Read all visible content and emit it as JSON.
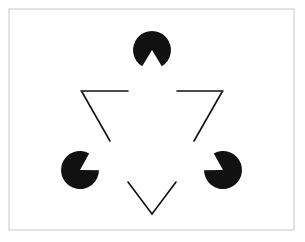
{
  "figure": {
    "name": "Kanizsa triangle illusion",
    "caption": "",
    "canvas": {
      "width": 305,
      "height": 242
    },
    "colors": {
      "background": "#ffffff",
      "ink": "#111111",
      "frame": "#d8d8d8",
      "page": "#ffffff"
    },
    "frame": {
      "x": 9,
      "y": 9,
      "width": 285,
      "height": 221,
      "stroke_width": 1.4
    },
    "illusory_triangle": {
      "description": "upward-pointing illusory triangle formed by three notched disks",
      "apex": {
        "x": 152,
        "y": 36
      },
      "left_vertex": {
        "x": 83,
        "y": 168
      },
      "right_vertex": {
        "x": 221,
        "y": 168
      }
    },
    "outlined_triangle": {
      "description": "inverted open-outline triangle, occluded by the three disks",
      "stroke_width": 1.6,
      "vertices": [
        {
          "name": "upper-left",
          "x": 81,
          "y": 91
        },
        {
          "name": "upper-right",
          "x": 223,
          "y": 91
        },
        {
          "name": "bottom",
          "x": 152,
          "y": 214
        }
      ],
      "segments": [
        {
          "name": "top-left-segment",
          "x1": 81,
          "y1": 91,
          "x2": 128,
          "y2": 91
        },
        {
          "name": "top-right-segment",
          "x1": 177,
          "y1": 91,
          "x2": 223,
          "y2": 91
        },
        {
          "name": "left-upper-segment",
          "x1": 82,
          "y1": 92,
          "x2": 110,
          "y2": 141
        },
        {
          "name": "left-lower-segment",
          "x1": 128,
          "y1": 182,
          "x2": 152,
          "y2": 214
        },
        {
          "name": "right-upper-segment",
          "x1": 222,
          "y1": 92,
          "x2": 194,
          "y2": 141
        },
        {
          "name": "right-lower-segment",
          "x1": 176,
          "y1": 182,
          "x2": 152,
          "y2": 214
        }
      ]
    },
    "disks": [
      {
        "name": "top-disk",
        "label": "top pac-man",
        "cx": 152,
        "cy": 50,
        "r": 19,
        "notch_bisector_deg": 90,
        "notch_half_angle_deg": 31
      },
      {
        "name": "bottom-left-disk",
        "label": "bottom-left pac-man",
        "cx": 80,
        "cy": 170,
        "r": 19,
        "notch_bisector_deg": 330,
        "notch_half_angle_deg": 31
      },
      {
        "name": "bottom-right-disk",
        "label": "bottom-right pac-man",
        "cx": 223,
        "cy": 170,
        "r": 19,
        "notch_bisector_deg": 210,
        "notch_half_angle_deg": 31
      }
    ]
  }
}
